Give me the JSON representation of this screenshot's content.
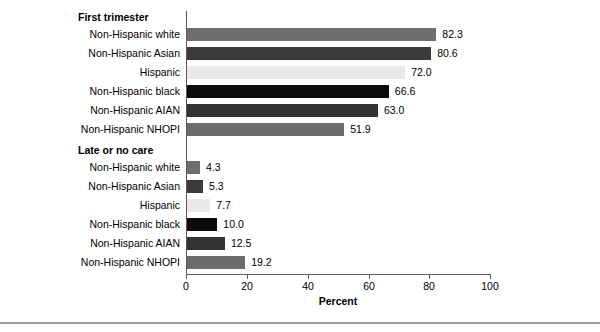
{
  "chart_data": {
    "type": "bar",
    "orientation": "horizontal",
    "title": "",
    "xlabel": "Percent",
    "ylabel": "",
    "xlim": [
      0,
      100
    ],
    "xticks": [
      0,
      20,
      40,
      60,
      80,
      100
    ],
    "xtick_labels": [
      "0",
      "20",
      "40",
      "60",
      "80",
      "100"
    ],
    "grid": false,
    "legend": "none",
    "groups": [
      {
        "label": "First trimester",
        "categories": [
          "Non-Hispanic white",
          "Non-Hispanic Asian",
          "Hispanic",
          "Non-Hispanic black",
          "Non-Hispanic AIAN",
          "Non-Hispanic NHOPI"
        ],
        "values": [
          82.3,
          80.6,
          72.0,
          66.6,
          63.0,
          51.9
        ],
        "value_labels": [
          "82.3",
          "80.6",
          "72.0",
          "66.6",
          "63.0",
          "51.9"
        ],
        "colors": [
          "#6e6e6e",
          "#3b3b3b",
          "#e9e9e9",
          "#0b0b0b",
          "#343434",
          "#6b6b6b"
        ]
      },
      {
        "label": "Late or no care",
        "categories": [
          "Non-Hispanic white",
          "Non-Hispanic Asian",
          "Hispanic",
          "Non-Hispanic black",
          "Non-Hispanic AIAN",
          "Non-Hispanic NHOPI"
        ],
        "values": [
          4.3,
          5.3,
          7.7,
          10.0,
          12.5,
          19.2
        ],
        "value_labels": [
          "4.3",
          "5.3",
          "7.7",
          "10.0",
          "12.5",
          "19.2"
        ],
        "colors": [
          "#6e6e6e",
          "#3b3b3b",
          "#e9e9e9",
          "#0b0b0b",
          "#343434",
          "#6b6b6b"
        ]
      }
    ]
  },
  "axis": {
    "x_title": "Percent",
    "tick_0": "0",
    "tick_1": "20",
    "tick_2": "40",
    "tick_3": "60",
    "tick_4": "80",
    "tick_5": "100"
  },
  "groups": {
    "first": {
      "header": "First trimester",
      "rows": [
        {
          "label": "Non-Hispanic white",
          "value_label": "82.3"
        },
        {
          "label": "Non-Hispanic Asian",
          "value_label": "80.6"
        },
        {
          "label": "Hispanic",
          "value_label": "72.0"
        },
        {
          "label": "Non-Hispanic black",
          "value_label": "66.6"
        },
        {
          "label": "Non-Hispanic AIAN",
          "value_label": "63.0"
        },
        {
          "label": "Non-Hispanic NHOPI",
          "value_label": "51.9"
        }
      ]
    },
    "late": {
      "header": "Late or no care",
      "rows": [
        {
          "label": "Non-Hispanic white",
          "value_label": "4.3"
        },
        {
          "label": "Non-Hispanic Asian",
          "value_label": "5.3"
        },
        {
          "label": "Hispanic",
          "value_label": "7.7"
        },
        {
          "label": "Non-Hispanic black",
          "value_label": "10.0"
        },
        {
          "label": "Non-Hispanic AIAN",
          "value_label": "12.5"
        },
        {
          "label": "Non-Hispanic NHOPI",
          "value_label": "19.2"
        }
      ]
    }
  }
}
